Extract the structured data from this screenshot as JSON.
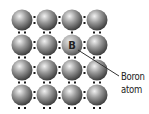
{
  "diagram": {
    "grid": {
      "rows": 4,
      "cols": 4,
      "x_centers": [
        22,
        47,
        72,
        97
      ],
      "y_centers": [
        20,
        45,
        70,
        95
      ],
      "atom_radius": 10.5
    },
    "atom_element": "silicon",
    "dopant": {
      "symbol": "B",
      "row": 1,
      "col": 2,
      "label_line1": "Boron",
      "label_line2": "atom"
    },
    "hole": {
      "row": 1,
      "col": 2,
      "position": "above",
      "description": "single electron (missing pair partner)"
    },
    "leader_line": {
      "x1": 78,
      "y1": 50,
      "x2": 119,
      "y2": 76
    },
    "colors": {
      "atom_highlight": "#f2f2f2",
      "atom_mid": "#9a9a9a",
      "atom_dark": "#3c3c3c",
      "boron_highlight": "#e6e6e6",
      "boron_mid": "#a8a8a8",
      "boron_dark": "#555555",
      "electron": "#1a1a1a",
      "line": "#333333",
      "text": "#222222"
    }
  }
}
